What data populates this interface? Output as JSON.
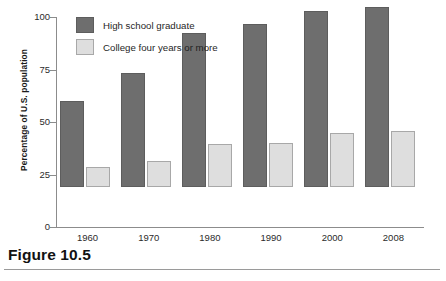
{
  "figure": {
    "caption": "Figure 10.5"
  },
  "chart_data": {
    "type": "bar",
    "title": "",
    "xlabel": "",
    "ylabel": "Percentage of U.S. population",
    "categories": [
      "1960",
      "1970",
      "1980",
      "1990",
      "2000",
      "2008"
    ],
    "series": [
      {
        "name": "High school graduate",
        "color": "#6e6e6e",
        "values": [
          41,
          54.5,
          73.5,
          77.5,
          84,
          85.5
        ]
      },
      {
        "name": "College four years or more",
        "color": "#dedede",
        "values": [
          9.5,
          12.5,
          20.5,
          21,
          25.5,
          26.5
        ]
      }
    ],
    "ylim": [
      0,
      100
    ],
    "yticks": [
      0,
      25,
      50,
      75,
      100
    ],
    "ytick_labels": [
      "0",
      "25",
      "50",
      "75",
      "100"
    ],
    "grid": false,
    "legend_position": "top-left-inside"
  }
}
